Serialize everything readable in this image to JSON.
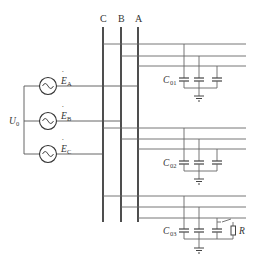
{
  "diagram": {
    "type": "three-phase neutral-ungrounded distribution network with single-phase ground fault",
    "bus_labels": [
      "C",
      "B",
      "A"
    ],
    "neutral_voltage_label": "U",
    "neutral_voltage_sub": "0",
    "sources": [
      {
        "label": "E",
        "sub": "A",
        "symbol": "ac-source"
      },
      {
        "label": "E",
        "sub": "B",
        "symbol": "ac-source"
      },
      {
        "label": "E",
        "sub": "C",
        "symbol": "ac-source"
      }
    ],
    "feeders": [
      {
        "cap_label": "C",
        "cap_sub": "01",
        "fault": false
      },
      {
        "cap_label": "C",
        "cap_sub": "02",
        "fault": false
      },
      {
        "cap_label": "C",
        "cap_sub": "03",
        "fault": true,
        "fault_resistor_label": "R"
      }
    ],
    "colors": {
      "bus": "#222222",
      "line": "#666666",
      "text": "#333333"
    }
  }
}
